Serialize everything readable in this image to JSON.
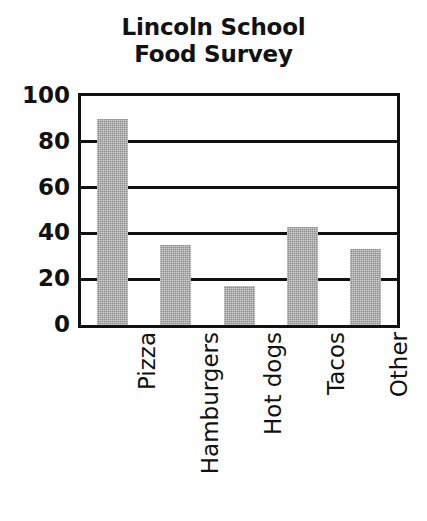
{
  "chart_data": {
    "type": "bar",
    "title": "Lincoln School Food Survey",
    "title_lines": [
      "Lincoln School",
      "Food Survey"
    ],
    "categories": [
      "Pizza",
      "Hamburgers",
      "Hot dogs",
      "Tacos",
      "Other"
    ],
    "values": [
      90,
      35,
      17,
      43,
      33
    ],
    "xlabel": "",
    "ylabel": "",
    "ylim": [
      0,
      100
    ],
    "yticks": [
      0,
      20,
      40,
      60,
      80,
      100
    ],
    "ytick_labels": [
      "0",
      "20",
      "40",
      "60",
      "80",
      "100"
    ],
    "grid": true,
    "grid_axis": "y",
    "legend": false,
    "legend_position": "none",
    "bar_color": "#8d8d8d",
    "axis_color": "#111111",
    "background_color": "#ffffff",
    "label_rotation": -90
  }
}
